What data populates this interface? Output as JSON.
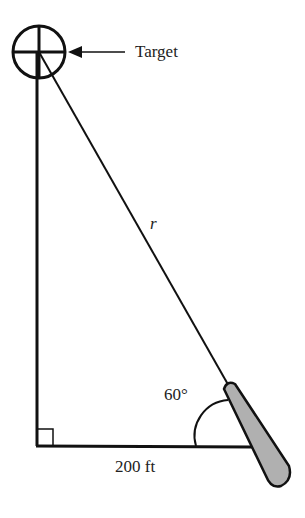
{
  "diagram": {
    "target_label": "Target",
    "hypotenuse_label": "r",
    "angle_label": "60°",
    "base_label": "200 ft",
    "colors": {
      "stroke": "#111111",
      "bat_fill": "#b0b0b0"
    }
  }
}
